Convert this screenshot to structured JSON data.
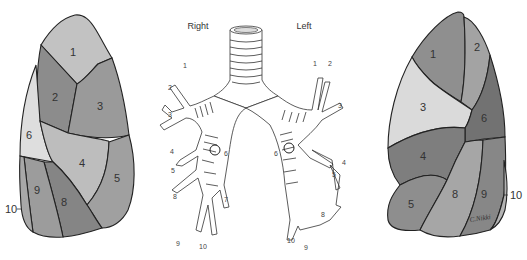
{
  "figure": {
    "side_labels": {
      "right": "Right",
      "left": "Left"
    },
    "colors": {
      "very_light": "#d9d9d9",
      "light": "#bdbdbd",
      "medium": "#a2a2a2",
      "dark": "#8a8a8a",
      "darker": "#777777",
      "outline": "#222222"
    },
    "right_lung_lateral": {
      "segments": [
        {
          "id": "1",
          "label": "1",
          "shade": "#c2c2c2"
        },
        {
          "id": "2",
          "label": "2",
          "shade": "#8c8c8c"
        },
        {
          "id": "3",
          "label": "3",
          "shade": "#9a9a9a"
        },
        {
          "id": "4",
          "label": "4",
          "shade": "#bdbdbd"
        },
        {
          "id": "5",
          "label": "5",
          "shade": "#a0a0a0"
        },
        {
          "id": "6",
          "label": "6",
          "shade": "#dedede"
        },
        {
          "id": "8",
          "label": "8",
          "shade": "#858585"
        },
        {
          "id": "9",
          "label": "9",
          "shade": "#9c9c9c"
        },
        {
          "id": "10",
          "label": "10",
          "shade": "#a8a8a8"
        }
      ]
    },
    "left_lung_lateral": {
      "segments": [
        {
          "id": "1",
          "label": "1",
          "shade": "#8f8f8f"
        },
        {
          "id": "2",
          "label": "2",
          "shade": "#a3a3a3"
        },
        {
          "id": "3",
          "label": "3",
          "shade": "#dadada"
        },
        {
          "id": "4",
          "label": "4",
          "shade": "#7e7e7e"
        },
        {
          "id": "5",
          "label": "5",
          "shade": "#8e8e8e"
        },
        {
          "id": "6",
          "label": "6",
          "shade": "#727272"
        },
        {
          "id": "8",
          "label": "8",
          "shade": "#a6a6a6"
        },
        {
          "id": "9",
          "label": "9",
          "shade": "#878787"
        },
        {
          "id": "10",
          "label": "10",
          "shade": "#b4b4b4"
        }
      ],
      "signature": "C.Nikki"
    },
    "bronchial_tree": {
      "right_labels": [
        "1",
        "2",
        "3",
        "4",
        "5",
        "6",
        "7",
        "8",
        "9",
        "10"
      ],
      "left_labels": [
        "1",
        "2",
        "3",
        "4",
        "5",
        "6",
        "8",
        "9",
        "10"
      ]
    }
  }
}
